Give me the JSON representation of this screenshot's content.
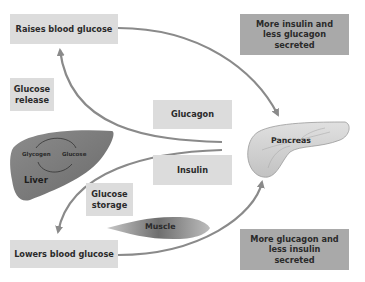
{
  "diagram": {
    "boxes": {
      "raises": "Raises blood glucose",
      "more_insulin": "More insulin and less glucagon secreted",
      "glucose_release": "Glucose release",
      "glucagon": "Glucagon",
      "insulin": "Insulin",
      "glucose_storage": "Glucose storage",
      "lowers": "Lowers blood glucose",
      "more_glucagon": "More glucagon and less insulin secreted"
    },
    "organs": {
      "liver": "Liver",
      "liver_cycle_left": "Glycogen",
      "liver_cycle_right": "Glucose",
      "pancreas": "Pancreas",
      "muscle": "Muscle"
    },
    "colors": {
      "light_box": "#dcdcdc",
      "dark_box": "#a9a9a9",
      "arrow": "#8a8a8a",
      "organ": "#7d7d7d",
      "pancreas": "#d2d2d2"
    }
  }
}
